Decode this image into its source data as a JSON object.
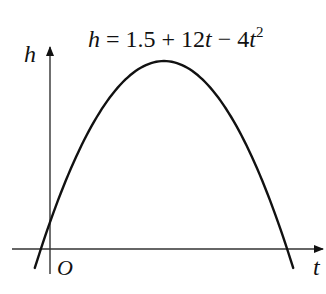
{
  "chart_data": {
    "type": "line",
    "equation": {
      "h": "h",
      "eq": " = 1.5 + 12",
      "t1": "t",
      "minus": " − 4",
      "t2": "t",
      "exp": "2"
    },
    "xlabel": "t",
    "ylabel": "h",
    "origin_label": "O",
    "function": "h = 1.5 + 12t - 4t^2",
    "coefficients": {
      "a": -4,
      "b": 12,
      "c": 1.5
    },
    "x": [
      -0.2,
      0,
      0.5,
      1,
      1.5,
      2,
      2.5,
      3,
      3.2
    ],
    "values": [
      -1.06,
      1.5,
      6.5,
      9.5,
      10.5,
      9.5,
      6.5,
      1.5,
      -1.06
    ],
    "vertex": {
      "t": 1.5,
      "h": 10.5
    },
    "roots": [
      -0.12,
      3.12
    ],
    "grid": false,
    "axis_ticks": false
  }
}
